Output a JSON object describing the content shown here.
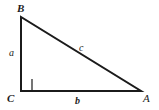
{
  "figure": {
    "name": "right-triangle",
    "background_color": "#ffffff",
    "stroke_color": "#1b1b1b",
    "vertices": {
      "a": {
        "label": "A",
        "x": 141,
        "y": 91
      },
      "b": {
        "label": "B",
        "x": 21,
        "y": 17
      },
      "c": {
        "label": "C",
        "x": 21,
        "y": 91
      }
    },
    "sides": {
      "a": {
        "label": "a",
        "from": "B",
        "to": "C"
      },
      "b": {
        "label": "b",
        "from": "C",
        "to": "A"
      },
      "c": {
        "label": "c",
        "from": "A",
        "to": "B"
      }
    },
    "right_angle": {
      "at_vertex": "C",
      "marker_size": 11
    }
  }
}
